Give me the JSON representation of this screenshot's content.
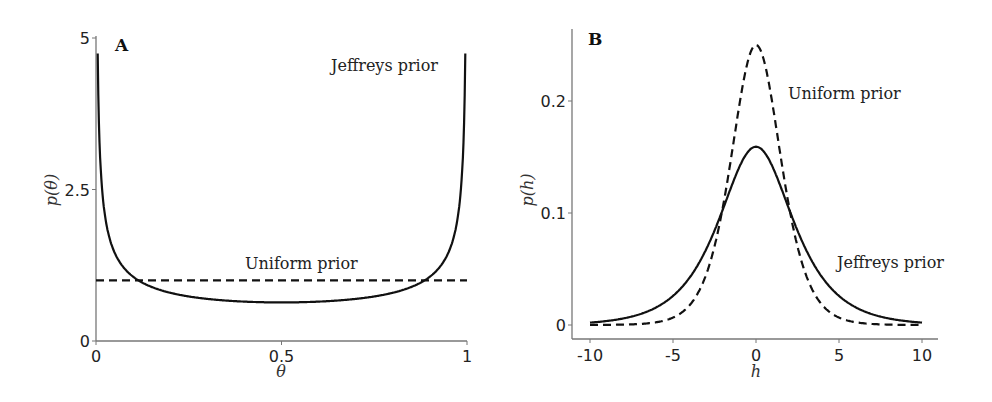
{
  "chart_data": [
    {
      "panel": "A",
      "type": "line",
      "xlabel": "θ",
      "ylabel": "p(θ)",
      "xlim": [
        0,
        1
      ],
      "ylim": [
        0,
        5
      ],
      "xticks": [
        "0",
        "0.5",
        "1"
      ],
      "yticks": [
        "0",
        "2.5",
        "5"
      ],
      "grid": false,
      "series": [
        {
          "name": "Jeffreys prior",
          "style": "solid",
          "function": "1/(pi*sqrt(theta*(1-theta)))",
          "x": [
            0.01,
            0.05,
            0.1,
            0.2,
            0.3,
            0.4,
            0.5,
            0.6,
            0.7,
            0.8,
            0.9,
            0.95,
            0.99
          ],
          "values": [
            3.2,
            1.46,
            1.06,
            0.8,
            0.69,
            0.65,
            0.64,
            0.65,
            0.69,
            0.8,
            1.06,
            1.46,
            3.2
          ]
        },
        {
          "name": "Uniform prior",
          "style": "dashed",
          "function": "1",
          "x": [
            0,
            1
          ],
          "values": [
            1,
            1
          ]
        }
      ],
      "annotations": [
        {
          "text": "Jeffreys prior",
          "x": 0.85,
          "y": 4.6
        },
        {
          "text": "Uniform prior",
          "x": 0.6,
          "y": 1.3
        }
      ]
    },
    {
      "panel": "B",
      "type": "line",
      "xlabel": "h",
      "ylabel": "p(h)",
      "xlim": [
        -10,
        10
      ],
      "ylim": [
        0,
        0.26
      ],
      "xticks": [
        "-10",
        "-5",
        "0",
        "5",
        "10"
      ],
      "yticks": [
        "0",
        "0.1",
        "0.2"
      ],
      "grid": false,
      "series": [
        {
          "name": "Uniform prior",
          "style": "dashed",
          "function": "e^h/(1+e^h)^2",
          "x": [
            -10,
            -5,
            -2,
            -1,
            0,
            1,
            2,
            5,
            10
          ],
          "values": [
            5e-05,
            0.0066,
            0.105,
            0.197,
            0.25,
            0.197,
            0.105,
            0.0066,
            5e-05
          ]
        },
        {
          "name": "Jeffreys prior",
          "style": "solid",
          "function": "sqrt(e^h)/(pi*(1+e^h))",
          "x": [
            -10,
            -5,
            -2,
            -1,
            0,
            1,
            2,
            5,
            10
          ],
          "values": [
            0.0021,
            0.026,
            0.11,
            0.141,
            0.159,
            0.141,
            0.11,
            0.026,
            0.0021
          ]
        }
      ],
      "annotations": [
        {
          "text": "Uniform prior",
          "x": 2,
          "y": 0.205
        },
        {
          "text": "Jeffreys prior",
          "x": 5,
          "y": 0.07
        }
      ]
    }
  ],
  "labels": {
    "panelA": "A",
    "panelB": "B",
    "jeffreysA": "Jeffreys prior",
    "uniformA": "Uniform prior",
    "uniformB": "Uniform prior",
    "jeffreysB": "Jeffreys prior",
    "xlabelA": "θ",
    "ylabelA": "p(θ)",
    "xlabelB": "h",
    "ylabelB": "p(h)"
  }
}
